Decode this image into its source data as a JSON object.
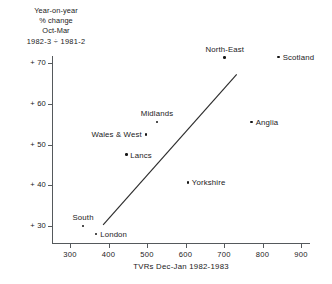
{
  "caption": {
    "line1": "Year-on-year",
    "line2": "% change",
    "line3": "Oct-Mar",
    "line4": "1982-3 ÷ 1981-2"
  },
  "axes": {
    "x_title": "TVRs Dec-Jan 1982-1983",
    "x_ticks": [
      "300",
      "400",
      "500",
      "600",
      "700",
      "800",
      "900"
    ],
    "y_ticks": [
      "+ 70",
      "+ 60",
      "+ 50",
      "+ 40",
      "+ 30"
    ]
  },
  "chart_data": {
    "type": "scatter",
    "title": "",
    "xlabel": "TVRs Dec-Jan 1982-1983",
    "ylabel": "Year-on-year % change Oct-Mar 1982-3 ÷ 1981-2",
    "xlim": [
      270,
      920
    ],
    "ylim": [
      26,
      74
    ],
    "xticks": [
      300,
      400,
      500,
      600,
      700,
      800,
      900
    ],
    "yticks": [
      30,
      40,
      50,
      60,
      70
    ],
    "grid": false,
    "legend": false,
    "points": [
      {
        "label": "South",
        "x": 334,
        "y": 30.0,
        "label_pos": "above"
      },
      {
        "label": "London",
        "x": 368,
        "y": 28.0,
        "label_pos": "right"
      },
      {
        "label": "Lancs",
        "x": 446,
        "y": 47.5,
        "label_pos": "right"
      },
      {
        "label": "Wales & West",
        "x": 497,
        "y": 52.5,
        "label_pos": "left"
      },
      {
        "label": "Midlands",
        "x": 526,
        "y": 55.5,
        "label_pos": "above"
      },
      {
        "label": "Yorkshire",
        "x": 606,
        "y": 40.7,
        "label_pos": "right"
      },
      {
        "label": "North-East",
        "x": 702,
        "y": 71.3,
        "label_pos": "above"
      },
      {
        "label": "Anglia",
        "x": 772,
        "y": 55.5,
        "label_pos": "right"
      },
      {
        "label": "Scotland",
        "x": 842,
        "y": 71.5,
        "label_pos": "right"
      }
    ],
    "trend_line": {
      "x_start": 386,
      "y_start": 30.3,
      "x_end": 733,
      "y_end": 67.2,
      "color": "#2b2b2b"
    }
  }
}
